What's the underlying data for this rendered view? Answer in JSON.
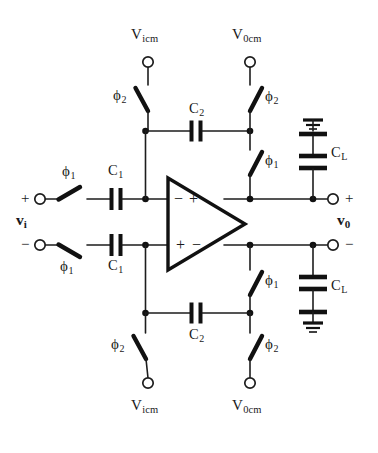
{
  "figure": {
    "kind": "circuit-schematic",
    "ink_color": "#111111",
    "background_color": "#ffffff"
  },
  "sources": {
    "top_left": {
      "label_main": "V",
      "label_sub": "icm"
    },
    "top_right": {
      "label_main": "V",
      "label_sub": "0cm"
    },
    "bottom_left": {
      "label_main": "V",
      "label_sub": "icm"
    },
    "bottom_right": {
      "label_main": "V",
      "label_sub": "0cm"
    }
  },
  "ports": {
    "input": {
      "name": "v",
      "sub": "i",
      "plus": "+",
      "minus": "−"
    },
    "output": {
      "name": "v",
      "sub": "0",
      "plus": "+",
      "minus": "−"
    }
  },
  "opamp": {
    "top_inputs": {
      "left": "−",
      "right": "+"
    },
    "bottom_inputs": {
      "left": "+",
      "right": "−"
    }
  },
  "switches": [
    {
      "id": "sw-top-left-icm",
      "phase": "ϕ",
      "sub": "2",
      "label_side": "left",
      "orientation": "down-right"
    },
    {
      "id": "sw-top-right-0cm",
      "phase": "ϕ",
      "sub": "2",
      "label_side": "right",
      "orientation": "down-left"
    },
    {
      "id": "sw-top-right-fb",
      "phase": "ϕ",
      "sub": "1",
      "label_side": "right",
      "orientation": "down-left"
    },
    {
      "id": "sw-in-plus",
      "phase": "ϕ",
      "sub": "1",
      "label_side": "above",
      "orientation": "down-right"
    },
    {
      "id": "sw-in-minus",
      "phase": "ϕ",
      "sub": "1",
      "label_side": "below",
      "orientation": "down-right"
    },
    {
      "id": "sw-bot-right-fb",
      "phase": "ϕ",
      "sub": "1",
      "label_side": "right",
      "orientation": "down-left"
    },
    {
      "id": "sw-bot-left-icm",
      "phase": "ϕ",
      "sub": "2",
      "label_side": "left",
      "orientation": "down-right"
    },
    {
      "id": "sw-bot-right-0cm",
      "phase": "ϕ",
      "sub": "2",
      "label_side": "right",
      "orientation": "down-left"
    }
  ],
  "capacitors": [
    {
      "id": "cap-c1-top",
      "label_main": "C",
      "label_sub": "1",
      "orientation": "vertical-plates"
    },
    {
      "id": "cap-c1-bottom",
      "label_main": "C",
      "label_sub": "1",
      "orientation": "vertical-plates"
    },
    {
      "id": "cap-c2-top",
      "label_main": "C",
      "label_sub": "2",
      "orientation": "vertical-plates"
    },
    {
      "id": "cap-c2-bottom",
      "label_main": "C",
      "label_sub": "2",
      "orientation": "vertical-plates"
    },
    {
      "id": "cap-cl-top",
      "label_main": "C",
      "label_sub": "L",
      "orientation": "horizontal-plates",
      "ground": "top"
    },
    {
      "id": "cap-cl-bottom",
      "label_main": "C",
      "label_sub": "L",
      "orientation": "horizontal-plates",
      "ground": "bottom"
    }
  ],
  "grounds": [
    {
      "id": "gnd-top",
      "attached_to": "cap-cl-top",
      "position": "above"
    },
    {
      "id": "gnd-bottom",
      "attached_to": "cap-cl-bottom",
      "position": "below"
    }
  ]
}
